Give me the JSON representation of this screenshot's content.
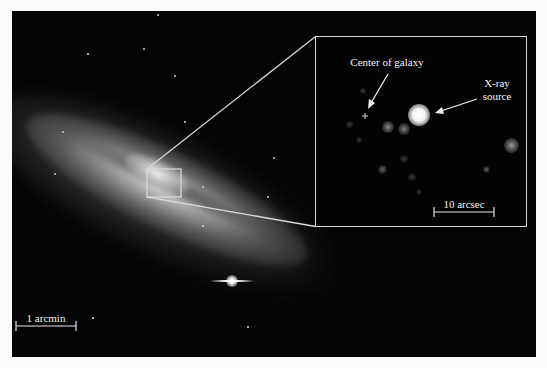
{
  "figure": {
    "background_color": "#fbfbfb",
    "photo_background": "#040404",
    "line_color": "#d8d8d8",
    "main_image": {
      "subject": "edge-on starburst galaxy",
      "scale_bar": {
        "label": "1 arcmin"
      }
    },
    "inset": {
      "labels": {
        "center": "Center of galaxy",
        "xray_line1": "X-ray",
        "xray_line2": "source"
      },
      "center_marker": "+",
      "scale_bar": {
        "label": "10 arcsec"
      }
    }
  }
}
